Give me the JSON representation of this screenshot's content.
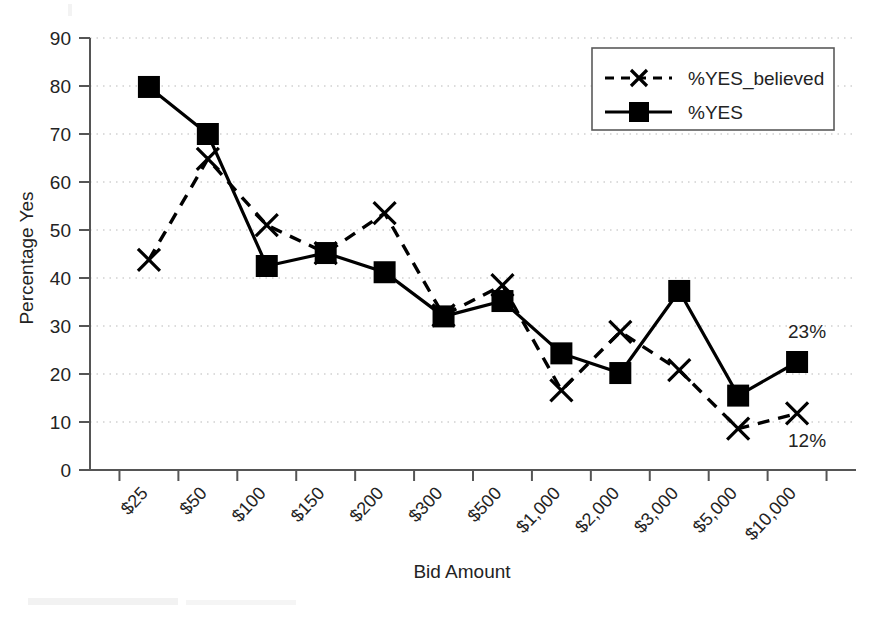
{
  "chart_data": {
    "type": "line",
    "title": "",
    "xlabel": "Bid Amount",
    "ylabel": "Percentage Yes",
    "categories": [
      "$25",
      "$50",
      "$100",
      "$150",
      "$200",
      "$300",
      "$500",
      "$1,000",
      "$2,000",
      "$3,000",
      "$5,000",
      "$10,000"
    ],
    "ylim": [
      0,
      90
    ],
    "yticks": [
      0,
      10,
      20,
      30,
      40,
      50,
      60,
      70,
      80,
      90
    ],
    "grid": true,
    "legend_position": "top-right",
    "series": [
      {
        "name": "%YES_believed",
        "marker": "x",
        "linestyle": "dashed",
        "values": [
          43.8,
          64.8,
          51.0,
          45.2,
          53.5,
          32.2,
          38.5,
          16.6,
          28.8,
          20.8,
          8.6,
          11.8
        ]
      },
      {
        "name": "%YES",
        "marker": "square",
        "linestyle": "solid",
        "values": [
          79.8,
          70.0,
          42.5,
          45.2,
          41.2,
          32.0,
          35.2,
          24.3,
          20.2,
          37.3,
          15.5,
          22.5
        ]
      }
    ],
    "annotations": [
      {
        "text": "23%",
        "series": "%YES",
        "category": "$10,000",
        "value": 22.5
      },
      {
        "text": "12%",
        "series": "%YES_believed",
        "category": "$10,000",
        "value": 11.8
      }
    ]
  },
  "legend": {
    "entries": [
      {
        "label": "%YES_believed"
      },
      {
        "label": "%YES"
      }
    ]
  },
  "axes": {
    "y_title": "Percentage Yes",
    "x_title": "Bid Amount",
    "y_tick_labels": [
      "90",
      "80",
      "70",
      "60",
      "50",
      "40",
      "30",
      "20",
      "10",
      "0"
    ],
    "x_tick_labels": [
      "$25",
      "$50",
      "$100",
      "$150",
      "$200",
      "$300",
      "$500",
      "$1,000",
      "$2,000",
      "$3,000",
      "$5,000",
      "$10,000"
    ]
  },
  "colors": {
    "ink": "#000000",
    "axis": "#555555",
    "grid": "#b9b9b9",
    "background": "#ffffff"
  }
}
